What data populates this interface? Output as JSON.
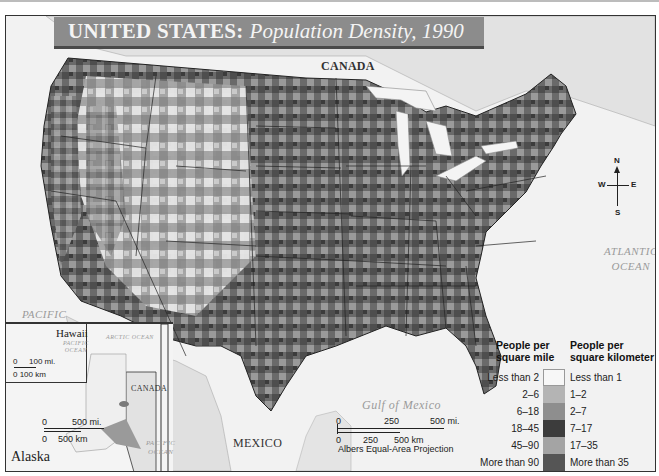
{
  "title": {
    "main": "UNITED STATES:",
    "subtitle": "Population Density, 1990"
  },
  "labels": {
    "canada": "CANADA",
    "mexico": "MEXICO",
    "atlantic_1": "ATLANTIC",
    "atlantic_2": "OCEAN",
    "pacific_1": "PACIFIC",
    "pacific_2": "OCEAN",
    "gulf": "Gulf of Mexico"
  },
  "compass": {
    "n": "N",
    "s": "S",
    "e": "E",
    "w": "W"
  },
  "legend": {
    "header_left": [
      "People per",
      "square mile"
    ],
    "header_right": [
      "People per",
      "square kilometer"
    ],
    "classes": [
      {
        "per_sq_mile": "Less than 2",
        "per_sq_km": "Less than 1",
        "color": "#f7f7f7"
      },
      {
        "per_sq_mile": "2–6",
        "per_sq_km": "1–2",
        "color": "#b4b4b4"
      },
      {
        "per_sq_mile": "6–18",
        "per_sq_km": "2–7",
        "color": "#8e8e8e"
      },
      {
        "per_sq_mile": "18–45",
        "per_sq_km": "7–17",
        "color": "#3c3c3c"
      },
      {
        "per_sq_mile": "45–90",
        "per_sq_km": "17–35",
        "color": "#a4a4a4"
      },
      {
        "per_sq_mile": "More than 90",
        "per_sq_km": "More than 35",
        "color": "#555555"
      }
    ]
  },
  "scale_main": {
    "mi": [
      "0",
      "250",
      "500 mi."
    ],
    "km": [
      "0",
      "250",
      "500 km"
    ],
    "projection": "Albers Equal-Area Projection"
  },
  "inset": {
    "alaska_label": "Alaska",
    "hawaii_label": "Hawaii",
    "hawaii_ocean_1": "PACIFIC",
    "hawaii_ocean_2": "OCEAN",
    "arctic": "ARCTIC OCEAN",
    "canada": "CANADA",
    "pacific_1": "PACIFIC",
    "pacific_2": "OCEAN",
    "hawaii_scale_mi": [
      "0",
      "100 mi."
    ],
    "hawaii_scale_km": "0 100 km",
    "alaska_scale_mi": [
      "0",
      "500 mi."
    ],
    "alaska_scale_km": [
      "0",
      "500 km"
    ]
  }
}
